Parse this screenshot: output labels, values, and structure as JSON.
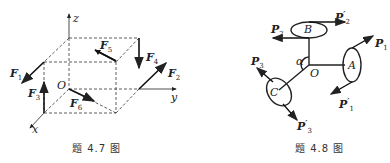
{
  "figure_4_7": {
    "caption": "题 4.7 图",
    "axes": {
      "x": "x",
      "y": "y",
      "z": "z",
      "origin": "O"
    },
    "forces": {
      "F1": {
        "name": "F",
        "sub": "1"
      },
      "F2": {
        "name": "F",
        "sub": "2"
      },
      "F3": {
        "name": "F",
        "sub": "3"
      },
      "F4": {
        "name": "F",
        "sub": "4"
      },
      "F5": {
        "name": "F",
        "sub": "5"
      },
      "F6": {
        "name": "F",
        "sub": "6"
      }
    }
  },
  "figure_4_8": {
    "caption": "题 4.8 图",
    "points": {
      "A": "A",
      "B": "B",
      "C": "C",
      "O": "O"
    },
    "angle": "α",
    "forces": {
      "P1": {
        "name": "P",
        "sub": "1",
        "prime": ""
      },
      "P1p": {
        "name": "P",
        "sub": "1",
        "prime": "′"
      },
      "P2": {
        "name": "P",
        "sub": "2",
        "prime": ""
      },
      "P2p": {
        "name": "P",
        "sub": "2",
        "prime": "′"
      },
      "P3": {
        "name": "P",
        "sub": "3",
        "prime": ""
      },
      "P3p": {
        "name": "P",
        "sub": "3",
        "prime": "′"
      }
    }
  }
}
